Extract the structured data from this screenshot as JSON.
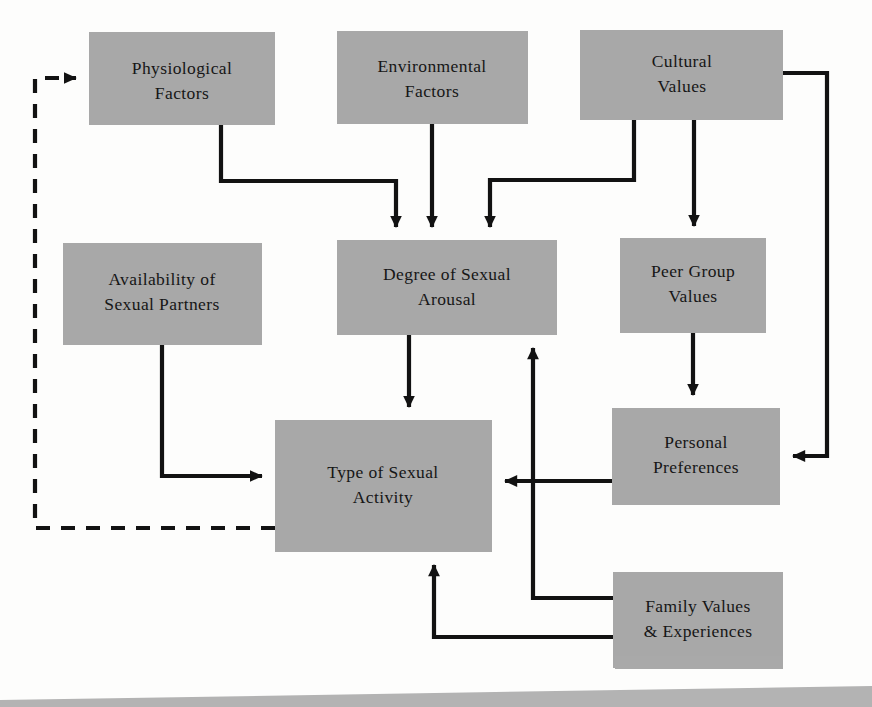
{
  "figure": {
    "type": "flowchart",
    "background_color": "#fdfdfc",
    "box_fill_color": "#a8a8a8",
    "line_color": "#121212",
    "nodes": [
      {
        "id": "physiological_factors",
        "label_line1": "Physiological",
        "label_line2": "Factors",
        "x": 89,
        "y": 32,
        "w": 186,
        "h": 93
      },
      {
        "id": "environmental_factors",
        "label_line1": "Environmental",
        "label_line2": "Factors",
        "x": 337,
        "y": 31,
        "w": 191,
        "h": 93
      },
      {
        "id": "cultural_values",
        "label_line1": "Cultural",
        "label_line2": "Values",
        "x": 580,
        "y": 30,
        "w": 203,
        "h": 90
      },
      {
        "id": "availability_of_sexual_partners",
        "label_line1": "Availability of",
        "label_line2": "Sexual Partners",
        "x": 63,
        "y": 243,
        "w": 199,
        "h": 102
      },
      {
        "id": "degree_of_sexual_arousal",
        "label_line1": "Degree of Sexual",
        "label_line2": "Arousal",
        "x": 337,
        "y": 240,
        "w": 220,
        "h": 95
      },
      {
        "id": "peer_group_values",
        "label_line1": "Peer Group",
        "label_line2": "Values",
        "x": 620,
        "y": 238,
        "w": 146,
        "h": 95
      },
      {
        "id": "type_of_sexual_activity",
        "label_line1": "Type of Sexual",
        "label_line2": "Activity",
        "x": 275,
        "y": 420,
        "w": 217,
        "h": 132
      },
      {
        "id": "personal_preferences",
        "label_line1": "Personal",
        "label_line2": "Preferences",
        "x": 612,
        "y": 408,
        "w": 168,
        "h": 97
      },
      {
        "id": "family_values_experiences",
        "label_line1": "Family Values",
        "label_line2": "& Experiences",
        "x": 613,
        "y": 572,
        "w": 170,
        "h": 96
      }
    ],
    "edges": [
      {
        "id": "physiological-to-arousal",
        "from": "physiological_factors",
        "to": "degree_of_sexual_arousal",
        "style": "solid",
        "arrow": true
      },
      {
        "id": "environmental-to-arousal",
        "from": "environmental_factors",
        "to": "degree_of_sexual_arousal",
        "style": "solid",
        "arrow": true
      },
      {
        "id": "cultural-to-arousal",
        "from": "cultural_values",
        "to": "degree_of_sexual_arousal",
        "style": "solid",
        "arrow": true
      },
      {
        "id": "cultural-to-peer-group",
        "from": "cultural_values",
        "to": "peer_group_values",
        "style": "solid",
        "arrow": true
      },
      {
        "id": "cultural-to-personal-preferences",
        "from": "cultural_values",
        "to": "personal_preferences",
        "style": "solid",
        "arrow": true
      },
      {
        "id": "availability-to-activity",
        "from": "availability_of_sexual_partners",
        "to": "type_of_sexual_activity",
        "style": "solid",
        "arrow": true
      },
      {
        "id": "arousal-to-activity",
        "from": "degree_of_sexual_arousal",
        "to": "type_of_sexual_activity",
        "style": "solid",
        "arrow": true
      },
      {
        "id": "peer-group-to-personal-preferences",
        "from": "peer_group_values",
        "to": "personal_preferences",
        "style": "solid",
        "arrow": true
      },
      {
        "id": "personal-preferences-to-activity",
        "from": "personal_preferences",
        "to": "type_of_sexual_activity",
        "style": "solid",
        "arrow": true
      },
      {
        "id": "family-values-to-arousal",
        "from": "family_values_experiences",
        "to": "degree_of_sexual_arousal",
        "style": "solid",
        "arrow": true
      },
      {
        "id": "family-values-to-activity",
        "from": "family_values_experiences",
        "to": "type_of_sexual_activity",
        "style": "solid",
        "arrow": true
      },
      {
        "id": "activity-to-physiological-feedback",
        "from": "type_of_sexual_activity",
        "to": "physiological_factors",
        "style": "dashed",
        "arrow": true
      }
    ]
  }
}
